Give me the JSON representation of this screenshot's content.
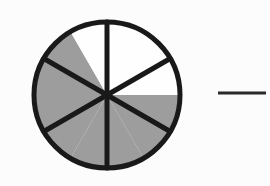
{
  "document": {
    "type": "fraction-circle-worksheet-item",
    "background_color": "#fdfdfd"
  },
  "chart_data": {
    "type": "pie",
    "title": "",
    "subtitle": "",
    "xlabel": "",
    "ylabel": "",
    "legend_position": "none",
    "grid": false,
    "total_sectors": 6,
    "shaded_sectors": 4,
    "unshaded_sectors": 2,
    "fraction_shaded": "4/6",
    "categories": [
      "sector-1",
      "sector-2",
      "sector-3",
      "sector-4",
      "sector-5",
      "sector-6"
    ],
    "values": [
      1,
      1,
      1,
      1,
      1,
      1
    ],
    "series": [
      {
        "name": "sectors",
        "values": [
          1,
          1,
          1,
          1,
          1,
          1
        ],
        "fills": [
          "unshaded",
          "shaded",
          "shaded",
          "shaded",
          "shaded",
          "unshaded"
        ]
      }
    ],
    "sector_angle_degrees": 60,
    "sectors": [
      {
        "name": "top-left",
        "start_deg": 240,
        "end_deg": 300,
        "fill": "unshaded"
      },
      {
        "name": "top-right",
        "start_deg": 300,
        "end_deg": 360,
        "fill": "unshaded"
      },
      {
        "name": "right",
        "start_deg": 0,
        "end_deg": 60,
        "fill": "shaded"
      },
      {
        "name": "bottom-right",
        "start_deg": 60,
        "end_deg": 120,
        "fill": "shaded"
      },
      {
        "name": "bottom-left",
        "start_deg": 120,
        "end_deg": 180,
        "fill": "shaded"
      },
      {
        "name": "left",
        "start_deg": 180,
        "end_deg": 240,
        "fill": "shaded"
      }
    ],
    "colors": {
      "shaded_fill": "#9e9e9e",
      "unshaded_fill": "#ffffff",
      "outline": "#1a1a1a",
      "background": "#fdfdfd"
    }
  },
  "figure": {
    "circle": {
      "center_x": 107,
      "center_y": 95,
      "radius": 73,
      "stroke_width": 5,
      "stroke_color": "#1a1a1a"
    },
    "spokes": {
      "count": 3,
      "stroke_width": 5,
      "stroke_color": "#1a1a1a",
      "angles_degrees": [
        90,
        30,
        150
      ]
    }
  },
  "answer_blank": {
    "label": "",
    "x_start": 218,
    "x_end": 266,
    "y": 93,
    "stroke_width": 3,
    "stroke_color": "#2b2b2b"
  }
}
